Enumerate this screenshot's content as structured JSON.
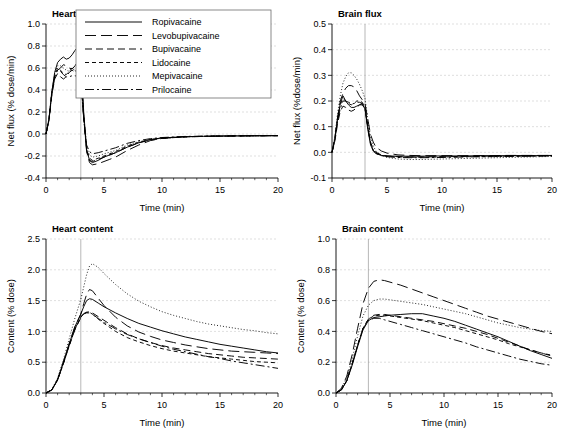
{
  "figure": {
    "background": "#ffffff",
    "curve_color": "#000000",
    "grid_color": "#c9c9c9",
    "marker_line_color": "#9a9a9a",
    "marker_time": 3
  },
  "legend": {
    "position": "top-left-panel",
    "entries": [
      {
        "label": "Ropivacaine",
        "style": "solid",
        "dash": "none"
      },
      {
        "label": "Levobupivacaine",
        "style": "long-dash",
        "dash": "11 5"
      },
      {
        "label": "Bupivacaine",
        "style": "medium-dash",
        "dash": "7 4"
      },
      {
        "label": "Lidocaine",
        "style": "short-dash",
        "dash": "4 3"
      },
      {
        "label": "Mepivacaine",
        "style": "dotted",
        "dash": "1 2"
      },
      {
        "label": "Prilocaine",
        "style": "dash-dot",
        "dash": "9 3 2 3"
      }
    ]
  },
  "chart_data": [
    {
      "id": "heart-flux",
      "type": "line",
      "title": "Heart flux",
      "xlabel": "Time (min)",
      "ylabel": "Net flux (% dose/min)",
      "xlim": [
        0,
        20
      ],
      "ylim": [
        -0.4,
        1.0
      ],
      "xticks": [
        0,
        5,
        10,
        15,
        20
      ],
      "yticks": [
        -0.4,
        -0.2,
        0.0,
        0.2,
        0.4,
        0.6,
        0.8,
        1.0
      ],
      "xtick_labels": [
        "0",
        "5",
        "10",
        "15",
        "20"
      ],
      "ytick_labels": [
        "-0.4",
        "-0.2",
        "0.0",
        "0.2",
        "0.4",
        "0.6",
        "0.8",
        "1.0"
      ],
      "grid": true,
      "x": [
        0,
        0.25,
        0.5,
        0.75,
        1,
        1.25,
        1.5,
        1.75,
        2,
        2.25,
        2.5,
        2.75,
        3,
        3.25,
        3.5,
        3.75,
        4,
        4.5,
        5,
        5.5,
        6,
        7,
        8,
        9,
        10,
        12,
        14,
        16,
        18,
        20
      ],
      "series": [
        {
          "name": "Ropivacaine",
          "values": [
            0,
            0.13,
            0.38,
            0.56,
            0.65,
            0.68,
            0.7,
            0.68,
            0.69,
            0.72,
            0.76,
            0.79,
            0.72,
            0.2,
            -0.14,
            -0.24,
            -0.26,
            -0.24,
            -0.21,
            -0.19,
            -0.17,
            -0.12,
            -0.08,
            -0.05,
            -0.035,
            -0.025,
            -0.02,
            -0.018,
            -0.016,
            -0.015
          ]
        },
        {
          "name": "Levobupivacaine",
          "values": [
            0,
            0.12,
            0.36,
            0.52,
            0.58,
            0.6,
            0.63,
            0.62,
            0.6,
            0.59,
            0.62,
            0.66,
            0.62,
            0.17,
            -0.16,
            -0.26,
            -0.28,
            -0.27,
            -0.25,
            -0.23,
            -0.21,
            -0.15,
            -0.1,
            -0.06,
            -0.04,
            -0.026,
            -0.021,
            -0.018,
            -0.016,
            -0.015
          ]
        },
        {
          "name": "Bupivacaine",
          "values": [
            0,
            0.12,
            0.35,
            0.5,
            0.55,
            0.52,
            0.5,
            0.52,
            0.56,
            0.58,
            0.56,
            0.54,
            0.5,
            0.14,
            -0.15,
            -0.24,
            -0.25,
            -0.23,
            -0.21,
            -0.19,
            -0.17,
            -0.12,
            -0.08,
            -0.055,
            -0.04,
            -0.026,
            -0.021,
            -0.018,
            -0.016,
            -0.015
          ]
        },
        {
          "name": "Lidocaine",
          "values": [
            0,
            0.13,
            0.37,
            0.53,
            0.6,
            0.58,
            0.55,
            0.54,
            0.57,
            0.6,
            0.58,
            0.55,
            0.52,
            0.15,
            -0.14,
            -0.22,
            -0.24,
            -0.22,
            -0.2,
            -0.18,
            -0.16,
            -0.11,
            -0.075,
            -0.05,
            -0.038,
            -0.025,
            -0.02,
            -0.018,
            -0.016,
            -0.015
          ]
        },
        {
          "name": "Mepivacaine",
          "values": [
            0,
            0.14,
            0.39,
            0.55,
            0.62,
            0.62,
            0.6,
            0.58,
            0.57,
            0.58,
            0.59,
            0.58,
            0.55,
            0.16,
            -0.12,
            -0.19,
            -0.21,
            -0.2,
            -0.18,
            -0.165,
            -0.15,
            -0.1,
            -0.07,
            -0.05,
            -0.036,
            -0.024,
            -0.02,
            -0.018,
            -0.016,
            -0.015
          ]
        },
        {
          "name": "Prilocaine",
          "values": [
            0,
            0.13,
            0.37,
            0.52,
            0.58,
            0.57,
            0.54,
            0.52,
            0.52,
            0.53,
            0.53,
            0.52,
            0.48,
            0.14,
            -0.1,
            -0.16,
            -0.18,
            -0.17,
            -0.155,
            -0.14,
            -0.125,
            -0.085,
            -0.06,
            -0.042,
            -0.032,
            -0.022,
            -0.019,
            -0.017,
            -0.016,
            -0.015
          ]
        }
      ]
    },
    {
      "id": "brain-flux",
      "type": "line",
      "title": "Brain flux",
      "xlabel": "Time (min)",
      "ylabel": "Net flux (%dose/min)",
      "xlim": [
        0,
        20
      ],
      "ylim": [
        -0.1,
        0.5
      ],
      "xticks": [
        0,
        5,
        10,
        15,
        20
      ],
      "yticks": [
        -0.1,
        0.0,
        0.1,
        0.2,
        0.3,
        0.4,
        0.5
      ],
      "xtick_labels": [
        "0",
        "5",
        "10",
        "15",
        "20"
      ],
      "ytick_labels": [
        "-0.1",
        "0.0",
        "0.1",
        "0.2",
        "0.3",
        "0.4",
        "0.5"
      ],
      "grid": true,
      "x": [
        0,
        0.25,
        0.5,
        0.75,
        1,
        1.25,
        1.5,
        1.75,
        2,
        2.25,
        2.5,
        2.75,
        3,
        3.25,
        3.5,
        3.75,
        4,
        4.5,
        5,
        6,
        7,
        8,
        10,
        12,
        14,
        16,
        18,
        20
      ],
      "series": [
        {
          "name": "Ropivacaine",
          "values": [
            0,
            0.05,
            0.13,
            0.19,
            0.22,
            0.2,
            0.185,
            0.175,
            0.175,
            0.18,
            0.185,
            0.185,
            0.17,
            0.09,
            0.03,
            0.005,
            -0.005,
            -0.012,
            -0.014,
            -0.015,
            -0.015,
            -0.015,
            -0.014,
            -0.014,
            -0.013,
            -0.013,
            -0.013,
            -0.012
          ]
        },
        {
          "name": "Levobupivacaine",
          "values": [
            0,
            0.05,
            0.13,
            0.2,
            0.23,
            0.25,
            0.26,
            0.26,
            0.255,
            0.24,
            0.22,
            0.205,
            0.19,
            0.13,
            0.07,
            0.04,
            0.02,
            0.005,
            -0.003,
            -0.01,
            -0.012,
            -0.013,
            -0.013,
            -0.013,
            -0.013,
            -0.012,
            -0.012,
            -0.012
          ]
        },
        {
          "name": "Bupivacaine",
          "values": [
            0,
            0.04,
            0.11,
            0.16,
            0.18,
            0.175,
            0.165,
            0.16,
            0.165,
            0.175,
            0.185,
            0.19,
            0.175,
            0.1,
            0.04,
            0.012,
            0.0,
            -0.01,
            -0.014,
            -0.017,
            -0.018,
            -0.018,
            -0.017,
            -0.016,
            -0.015,
            -0.014,
            -0.014,
            -0.013
          ]
        },
        {
          "name": "Lidocaine",
          "values": [
            0,
            0.05,
            0.13,
            0.185,
            0.21,
            0.2,
            0.19,
            0.185,
            0.19,
            0.2,
            0.2,
            0.195,
            0.175,
            0.1,
            0.035,
            0.008,
            -0.003,
            -0.012,
            -0.016,
            -0.018,
            -0.019,
            -0.019,
            -0.018,
            -0.017,
            -0.016,
            -0.015,
            -0.014,
            -0.013
          ]
        },
        {
          "name": "Mepivacaine",
          "values": [
            0,
            0.06,
            0.15,
            0.22,
            0.27,
            0.295,
            0.31,
            0.31,
            0.3,
            0.285,
            0.265,
            0.24,
            0.21,
            0.13,
            0.06,
            0.025,
            0.005,
            -0.012,
            -0.02,
            -0.026,
            -0.028,
            -0.028,
            -0.026,
            -0.024,
            -0.022,
            -0.02,
            -0.018,
            -0.016
          ]
        },
        {
          "name": "Prilocaine",
          "values": [
            0,
            0.05,
            0.12,
            0.17,
            0.2,
            0.2,
            0.195,
            0.19,
            0.19,
            0.195,
            0.195,
            0.19,
            0.17,
            0.1,
            0.035,
            0.008,
            -0.004,
            -0.013,
            -0.017,
            -0.02,
            -0.021,
            -0.021,
            -0.02,
            -0.018,
            -0.017,
            -0.016,
            -0.015,
            -0.014
          ]
        }
      ]
    },
    {
      "id": "heart-content",
      "type": "line",
      "title": "Heart content",
      "xlabel": "Time (min)",
      "ylabel": "Content (% dose)",
      "xlim": [
        0,
        20
      ],
      "ylim": [
        0.0,
        2.5
      ],
      "xticks": [
        0,
        5,
        10,
        15,
        20
      ],
      "yticks": [
        0.0,
        0.5,
        1.0,
        1.5,
        2.0,
        2.5
      ],
      "xtick_labels": [
        "0",
        "5",
        "10",
        "15",
        "20"
      ],
      "ytick_labels": [
        "0.0",
        "0.5",
        "1.0",
        "1.5",
        "2.0",
        "2.5"
      ],
      "grid": true,
      "x": [
        0,
        0.5,
        1,
        1.5,
        2,
        2.5,
        3,
        3.25,
        3.5,
        3.75,
        4,
        4.5,
        5,
        6,
        7,
        8,
        9,
        10,
        11,
        12,
        13,
        14,
        15,
        16,
        17,
        18,
        19,
        20
      ],
      "series": [
        {
          "name": "Ropivacaine",
          "values": [
            0,
            0.05,
            0.22,
            0.5,
            0.8,
            1.08,
            1.28,
            1.4,
            1.5,
            1.53,
            1.52,
            1.46,
            1.4,
            1.3,
            1.21,
            1.13,
            1.07,
            1.01,
            0.96,
            0.91,
            0.87,
            0.83,
            0.79,
            0.76,
            0.73,
            0.7,
            0.67,
            0.65
          ]
        },
        {
          "name": "Levobupivacaine",
          "values": [
            0,
            0.05,
            0.22,
            0.5,
            0.8,
            1.08,
            1.28,
            1.45,
            1.6,
            1.68,
            1.66,
            1.54,
            1.42,
            1.23,
            1.09,
            0.99,
            0.92,
            0.86,
            0.82,
            0.78,
            0.75,
            0.72,
            0.7,
            0.68,
            0.67,
            0.66,
            0.65,
            0.64
          ]
        },
        {
          "name": "Bupivacaine",
          "values": [
            0,
            0.05,
            0.21,
            0.48,
            0.77,
            1.03,
            1.22,
            1.28,
            1.31,
            1.32,
            1.3,
            1.24,
            1.18,
            1.06,
            0.96,
            0.88,
            0.82,
            0.77,
            0.73,
            0.7,
            0.67,
            0.64,
            0.62,
            0.6,
            0.58,
            0.57,
            0.56,
            0.55
          ]
        },
        {
          "name": "Lidocaine",
          "values": [
            0,
            0.05,
            0.21,
            0.48,
            0.77,
            1.04,
            1.23,
            1.28,
            1.3,
            1.3,
            1.28,
            1.2,
            1.13,
            1.0,
            0.9,
            0.83,
            0.77,
            0.72,
            0.68,
            0.65,
            0.62,
            0.59,
            0.57,
            0.55,
            0.53,
            0.51,
            0.5,
            0.49
          ]
        },
        {
          "name": "Mepivacaine",
          "values": [
            0,
            0.06,
            0.24,
            0.54,
            0.88,
            1.22,
            1.52,
            1.72,
            1.92,
            2.06,
            2.1,
            2.04,
            1.94,
            1.76,
            1.61,
            1.49,
            1.4,
            1.32,
            1.26,
            1.21,
            1.16,
            1.12,
            1.09,
            1.06,
            1.03,
            1.01,
            0.98,
            0.96
          ]
        },
        {
          "name": "Prilocaine",
          "values": [
            0,
            0.05,
            0.21,
            0.48,
            0.77,
            1.04,
            1.24,
            1.29,
            1.31,
            1.31,
            1.28,
            1.21,
            1.15,
            1.04,
            0.95,
            0.88,
            0.82,
            0.76,
            0.71,
            0.67,
            0.63,
            0.59,
            0.56,
            0.52,
            0.49,
            0.46,
            0.43,
            0.4
          ]
        }
      ]
    },
    {
      "id": "brain-content",
      "type": "line",
      "title": "Brain content",
      "xlabel": "Time (min)",
      "ylabel": "Content (% dose)",
      "xlim": [
        0,
        20
      ],
      "ylim": [
        0.0,
        1.0
      ],
      "xticks": [
        0,
        5,
        10,
        15,
        20
      ],
      "yticks": [
        0.0,
        0.2,
        0.4,
        0.6,
        0.8,
        1.0
      ],
      "xtick_labels": [
        "0",
        "5",
        "10",
        "15",
        "20"
      ],
      "ytick_labels": [
        "0.0",
        "0.2",
        "0.4",
        "0.6",
        "0.8",
        "1.0"
      ],
      "grid": true,
      "x": [
        0,
        0.5,
        1,
        1.5,
        2,
        2.5,
        3,
        3.5,
        4,
        4.5,
        5,
        6,
        7,
        8,
        9,
        10,
        11,
        12,
        13,
        14,
        15,
        16,
        17,
        18,
        19,
        20
      ],
      "series": [
        {
          "name": "Ropivacaine",
          "values": [
            0,
            0.02,
            0.08,
            0.18,
            0.3,
            0.41,
            0.47,
            0.49,
            0.495,
            0.5,
            0.505,
            0.51,
            0.515,
            0.515,
            0.5,
            0.485,
            0.465,
            0.44,
            0.415,
            0.39,
            0.365,
            0.335,
            0.305,
            0.275,
            0.25,
            0.225
          ]
        },
        {
          "name": "Levobupivacaine",
          "values": [
            0,
            0.03,
            0.11,
            0.25,
            0.42,
            0.58,
            0.68,
            0.725,
            0.735,
            0.73,
            0.72,
            0.7,
            0.675,
            0.65,
            0.625,
            0.6,
            0.575,
            0.55,
            0.525,
            0.5,
            0.48,
            0.46,
            0.44,
            0.42,
            0.4,
            0.385
          ]
        },
        {
          "name": "Bupivacaine",
          "values": [
            0,
            0.02,
            0.08,
            0.19,
            0.31,
            0.42,
            0.48,
            0.505,
            0.51,
            0.51,
            0.505,
            0.495,
            0.485,
            0.475,
            0.465,
            0.45,
            0.435,
            0.42,
            0.4,
            0.38,
            0.355,
            0.33,
            0.305,
            0.28,
            0.26,
            0.24
          ]
        },
        {
          "name": "Lidocaine",
          "values": [
            0,
            0.02,
            0.08,
            0.19,
            0.31,
            0.42,
            0.48,
            0.5,
            0.505,
            0.505,
            0.5,
            0.49,
            0.48,
            0.47,
            0.455,
            0.44,
            0.425,
            0.405,
            0.385,
            0.365,
            0.345,
            0.32,
            0.3,
            0.28,
            0.26,
            0.245
          ]
        },
        {
          "name": "Mepivacaine",
          "values": [
            0,
            0.03,
            0.1,
            0.22,
            0.37,
            0.5,
            0.57,
            0.6,
            0.61,
            0.61,
            0.605,
            0.595,
            0.585,
            0.575,
            0.56,
            0.545,
            0.53,
            0.515,
            0.495,
            0.475,
            0.455,
            0.44,
            0.425,
            0.415,
            0.405,
            0.4
          ]
        },
        {
          "name": "Prilocaine",
          "values": [
            0,
            0.02,
            0.08,
            0.19,
            0.31,
            0.42,
            0.47,
            0.485,
            0.485,
            0.475,
            0.465,
            0.445,
            0.425,
            0.405,
            0.385,
            0.365,
            0.345,
            0.325,
            0.3,
            0.28,
            0.26,
            0.24,
            0.22,
            0.205,
            0.19,
            0.18
          ]
        }
      ]
    }
  ]
}
